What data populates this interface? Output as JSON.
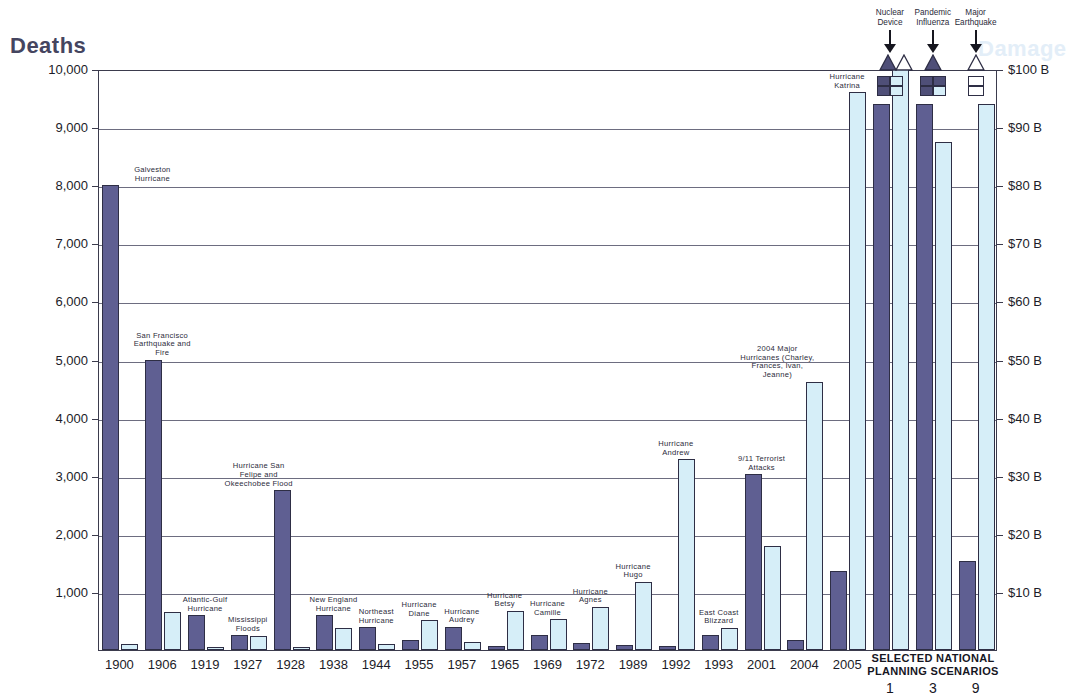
{
  "titles": {
    "left_axis": "Deaths",
    "right_axis": "Damage"
  },
  "scenario_header": "SELECTED NATIONAL\nPLANNING SCENARIOS",
  "colors": {
    "deaths_bar": "#5f5f92",
    "damage_bar": "#d6eef8",
    "axis": "#3b3b4d",
    "grid": "#6d6d80",
    "right_title": "#e3eef8"
  },
  "top_annotations": [
    {
      "label": "Nuclear\nDevice",
      "scenario_number": "1"
    },
    {
      "label": "Pandemic\nInfluenza",
      "scenario_number": "3"
    },
    {
      "label": "Major\nEarthquake",
      "scenario_number": "9"
    }
  ],
  "chart_data": {
    "type": "bar",
    "xlabel": "",
    "ylabel": "Deaths",
    "y2label": "Damage",
    "ylim": [
      0,
      10000
    ],
    "y2lim": [
      0,
      100
    ],
    "grid": true,
    "legend_position": "none",
    "yticks": [
      "0",
      "1,000",
      "2,000",
      "3,000",
      "4,000",
      "5,000",
      "6,000",
      "7,000",
      "8,000",
      "9,000",
      "10,000"
    ],
    "y2ticks": [
      "$10 B",
      "$20 B",
      "$30 B",
      "$40 B",
      "$50 B",
      "$60 B",
      "$70 B",
      "$80 B",
      "$90 B",
      "$100 B"
    ],
    "series": [
      {
        "name": "Deaths",
        "axis": "left",
        "color": "#5f5f92"
      },
      {
        "name": "Damage",
        "axis": "right",
        "color": "#d6eef8"
      }
    ],
    "categories": [
      "1900",
      "1906",
      "1919",
      "1927",
      "1928",
      "1938",
      "1944",
      "1955",
      "1957",
      "1965",
      "1969",
      "1972",
      "1989",
      "1992",
      "1993",
      "2001",
      "2004",
      "2005",
      "1",
      "3",
      "9"
    ],
    "points": [
      {
        "x": "1900",
        "label": "Galveston\nHurricane",
        "deaths": 8000,
        "damage": 1.0
      },
      {
        "x": "1906",
        "label": "San Francisco\nEarthquake and\nFire",
        "deaths": 5000,
        "damage": 6.5
      },
      {
        "x": "1919",
        "label": "Atlantic-Gulf\nHurricane",
        "deaths": 600,
        "damage": 0.6
      },
      {
        "x": "1927",
        "label": "Mississippi\nFloods",
        "deaths": 250,
        "damage": 2.4
      },
      {
        "x": "1928",
        "label": "Hurricane San\nFelipe and\nOkeechobee Flood",
        "deaths": 2750,
        "damage": 0.5
      },
      {
        "x": "1938",
        "label": "New England\nHurricane",
        "deaths": 600,
        "damage": 3.8
      },
      {
        "x": "1944",
        "label": "Northeast\nHurricane",
        "deaths": 390,
        "damage": 1.0
      },
      {
        "x": "1955",
        "label": "Hurricane\nDiane",
        "deaths": 180,
        "damage": 5.1
      },
      {
        "x": "1957",
        "label": "Hurricane\nAudrey",
        "deaths": 400,
        "damage": 1.3
      },
      {
        "x": "1965",
        "label": "Hurricane\nBetsy",
        "deaths": 75,
        "damage": 6.7
      },
      {
        "x": "1969",
        "label": "Hurricane\nCamille",
        "deaths": 260,
        "damage": 5.3
      },
      {
        "x": "1972",
        "label": "Hurricane\nAgnes",
        "deaths": 120,
        "damage": 7.4
      },
      {
        "x": "1989",
        "label": "Hurricane\nHugo",
        "deaths": 85,
        "damage": 11.7
      },
      {
        "x": "1992",
        "label": "Hurricane\nAndrew",
        "deaths": 65,
        "damage": 32.8
      },
      {
        "x": "1993",
        "label": "East Coast\nBlizzard",
        "deaths": 250,
        "damage": 3.8
      },
      {
        "x": "2001",
        "label": "9/11 Terrorist\nAttacks",
        "deaths": 3025,
        "damage": 17.9
      },
      {
        "x": "2004",
        "label": "2004 Major\nHurricanes (Charley,\nFrances, Ivan,\nJeanne)",
        "deaths": 170,
        "damage": 46.2
      },
      {
        "x": "2005",
        "label": "Hurricane\nKatrina",
        "deaths": 1360,
        "damage": 96.0
      },
      {
        "x": "1",
        "label": "",
        "deaths": 9400,
        "damage": 100.0
      },
      {
        "x": "3",
        "label": "",
        "deaths": 9400,
        "damage": 87.5
      },
      {
        "x": "9",
        "label": "",
        "deaths": 1540,
        "damage": 94.0
      }
    ]
  }
}
